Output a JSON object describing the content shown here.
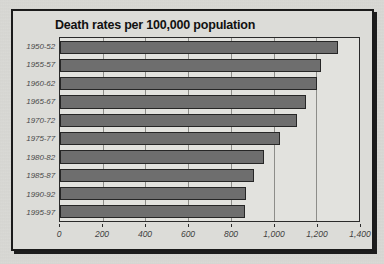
{
  "chart_data": {
    "type": "bar",
    "orientation": "horizontal",
    "title": "Death rates per 100,000 population",
    "xlabel": "",
    "ylabel": "",
    "categories": [
      "1950-52",
      "1955-57",
      "1960-62",
      "1965-67",
      "1970-72",
      "1975-77",
      "1980-82",
      "1985-87",
      "1990-92",
      "1995-97"
    ],
    "values": [
      1300,
      1220,
      1205,
      1150,
      1110,
      1030,
      955,
      910,
      870,
      865
    ],
    "xlim": [
      0,
      1400
    ],
    "xticks": [
      0,
      200,
      400,
      600,
      800,
      1000,
      1200,
      1400
    ],
    "xticklabels": [
      "0",
      "200",
      "400",
      "600",
      "800",
      "1,000",
      "1,200",
      "1,400"
    ],
    "grid": true,
    "grid_axis": "x",
    "legend": false,
    "bar_color": "#6e6e6e",
    "bar_border_color": "#262626",
    "plot_background": "#e2e2de",
    "panel_background": "#dcdcd8",
    "axis_color": "#2a2a2a",
    "gridline_color": "#8d8d89",
    "title_color": "#111111",
    "tick_label_color": "#3f3f3f"
  }
}
